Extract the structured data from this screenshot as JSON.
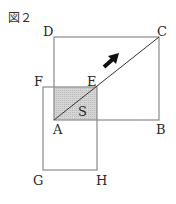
{
  "figure": {
    "title": "図２",
    "labels": {
      "A": "A",
      "B": "B",
      "C": "C",
      "D": "D",
      "E": "E",
      "F": "F",
      "G": "G",
      "H": "H",
      "S": "S"
    },
    "colors": {
      "line": "#8a8a8a",
      "diagonal": "#333333",
      "shade": "#cfcfcf",
      "arrow": "#111111",
      "text": "#2a2a2a"
    },
    "shapes": {
      "large_square": "ABCD",
      "small_square": "FEHG",
      "shaded_region": "overlap of squares (S)",
      "diagonal": "AC",
      "arrow_direction": "up-right along AC"
    }
  }
}
